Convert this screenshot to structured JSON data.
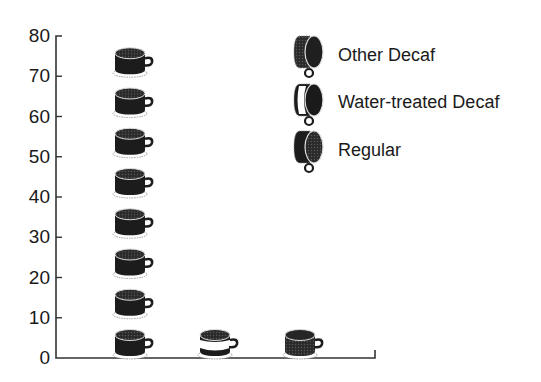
{
  "chart_data": {
    "type": "bar",
    "subtype": "pictogram",
    "title": "",
    "xlabel": "",
    "ylabel": "",
    "categories": [
      "Regular",
      "Water-treated Decaf",
      "Other Decaf"
    ],
    "values": [
      80,
      10,
      10
    ],
    "unit_per_icon": 10,
    "icon": "coffee-cup",
    "ylim": [
      0,
      80
    ],
    "yticks": [
      0,
      10,
      20,
      30,
      40,
      50,
      60,
      70,
      80
    ],
    "grid": false,
    "legend_position": "top-right",
    "legend": [
      {
        "label": "Other Decaf",
        "style": "dark-shaded"
      },
      {
        "label": "Water-treated Decaf",
        "style": "white-band"
      },
      {
        "label": "Regular",
        "style": "solid-dark"
      }
    ]
  },
  "colors": {
    "ink": "#1a1a1a",
    "cup_regular": "#1c1c1c",
    "cup_other_decaf": "#3a3a3a",
    "cup_water_band": "#ffffff",
    "background": "#ffffff"
  }
}
